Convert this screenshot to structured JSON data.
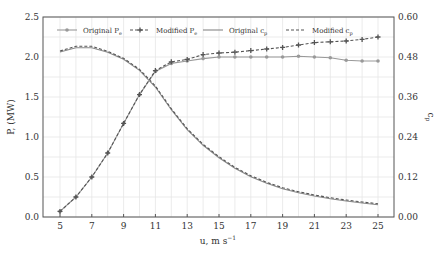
{
  "chart_data": {
    "type": "line",
    "title": "",
    "xlabel": "u, m s^-1",
    "ylabel": "P, (MW)",
    "y2label": "c_p",
    "xlim": [
      4.2,
      26.0
    ],
    "ylim": [
      0,
      2.5
    ],
    "y2lim": [
      0,
      0.6
    ],
    "xticks": [
      "5",
      "7",
      "9",
      "11",
      "13",
      "15",
      "17",
      "19",
      "21",
      "23",
      "25"
    ],
    "yticks": [
      "0.0",
      "0.5",
      "1.0",
      "1.5",
      "2.0",
      "2.5"
    ],
    "y2ticks": [
      "0.00",
      "0.12",
      "0.24",
      "0.36",
      "0.48",
      "0.60"
    ],
    "grid": true,
    "legend_position": "top, inside, single row",
    "x": [
      5,
      6,
      7,
      8,
      9,
      10,
      11,
      12,
      13,
      14,
      15,
      16,
      17,
      18,
      19,
      20,
      21,
      22,
      23,
      24,
      25
    ],
    "series": [
      {
        "name": "Original P_e",
        "axis": "left",
        "style": "solid-marker-dot",
        "color": "#999999",
        "values": [
          0.07,
          0.25,
          0.5,
          0.8,
          1.17,
          1.53,
          1.82,
          1.92,
          1.95,
          1.98,
          2.0,
          2.0,
          2.0,
          2.0,
          2.0,
          2.01,
          2.0,
          1.99,
          1.96,
          1.95,
          1.95
        ]
      },
      {
        "name": "Modified P_e",
        "axis": "left",
        "style": "dashed-marker-plus",
        "color": "#555555",
        "values": [
          0.07,
          0.25,
          0.5,
          0.8,
          1.17,
          1.53,
          1.83,
          1.94,
          1.97,
          2.03,
          2.05,
          2.06,
          2.08,
          2.1,
          2.12,
          2.15,
          2.18,
          2.19,
          2.2,
          2.22,
          2.25
        ]
      },
      {
        "name": "Original c_p",
        "axis": "right",
        "style": "solid",
        "color": "#888888",
        "values": [
          0.495,
          0.508,
          0.508,
          0.494,
          0.473,
          0.44,
          0.39,
          0.322,
          0.262,
          0.215,
          0.178,
          0.146,
          0.121,
          0.101,
          0.085,
          0.073,
          0.063,
          0.055,
          0.048,
          0.042,
          0.037
        ]
      },
      {
        "name": "Modified c_p",
        "axis": "right",
        "style": "dashed",
        "color": "#555555",
        "values": [
          0.498,
          0.512,
          0.512,
          0.497,
          0.476,
          0.443,
          0.393,
          0.325,
          0.265,
          0.218,
          0.181,
          0.149,
          0.124,
          0.104,
          0.088,
          0.076,
          0.066,
          0.058,
          0.051,
          0.045,
          0.04
        ]
      }
    ]
  },
  "legend": {
    "items": [
      "Original P_e",
      "Modified P_e",
      "Original c_p",
      "Modified c_p"
    ]
  },
  "axes": {
    "xlabel": "u, m s",
    "xlabel_sup": "−1",
    "ylabel": "P, (MW)",
    "y2label": "c",
    "y2label_sub": "p"
  }
}
